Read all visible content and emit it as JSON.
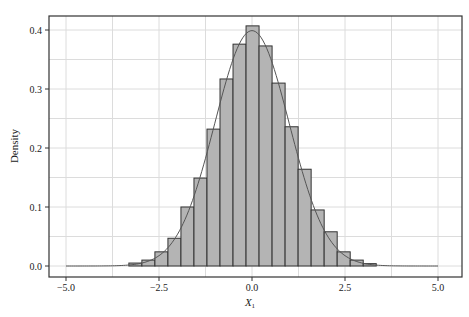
{
  "chart_data": {
    "type": "bar",
    "subtype": "histogram_with_density_curve",
    "title": "",
    "xlabel": "X",
    "xlabel_subscript": "1",
    "ylabel": "Density",
    "xlim": [
      -5.5,
      5.6
    ],
    "ylim": [
      -0.018,
      0.42
    ],
    "x_ticks": [
      -5.0,
      -2.5,
      0.0,
      2.5,
      5.0
    ],
    "x_tick_labels": [
      "−5.0",
      "−2.5",
      "0.0",
      "2.5",
      "5.0"
    ],
    "y_ticks": [
      0.0,
      0.1,
      0.2,
      0.3,
      0.4
    ],
    "y_tick_labels": [
      "0.0",
      "0.1",
      "0.2",
      "0.3",
      "0.4"
    ],
    "grid": true,
    "minor_grid": true,
    "legend": null,
    "bin_width": 0.35,
    "bins": [
      {
        "x0": -3.31,
        "x1": -2.96,
        "density": 0.005
      },
      {
        "x0": -2.96,
        "x1": -2.61,
        "density": 0.01
      },
      {
        "x0": -2.61,
        "x1": -2.26,
        "density": 0.024
      },
      {
        "x0": -2.26,
        "x1": -1.91,
        "density": 0.047
      },
      {
        "x0": -1.91,
        "x1": -1.56,
        "density": 0.1
      },
      {
        "x0": -1.56,
        "x1": -1.21,
        "density": 0.149
      },
      {
        "x0": -1.21,
        "x1": -0.86,
        "density": 0.232
      },
      {
        "x0": -0.86,
        "x1": -0.51,
        "density": 0.317
      },
      {
        "x0": -0.51,
        "x1": -0.16,
        "density": 0.376
      },
      {
        "x0": -0.16,
        "x1": 0.19,
        "density": 0.407
      },
      {
        "x0": 0.19,
        "x1": 0.54,
        "density": 0.373
      },
      {
        "x0": 0.54,
        "x1": 0.89,
        "density": 0.31
      },
      {
        "x0": 0.89,
        "x1": 1.24,
        "density": 0.236
      },
      {
        "x0": 1.24,
        "x1": 1.59,
        "density": 0.164
      },
      {
        "x0": 1.59,
        "x1": 1.94,
        "density": 0.095
      },
      {
        "x0": 1.94,
        "x1": 2.29,
        "density": 0.058
      },
      {
        "x0": 2.29,
        "x1": 2.64,
        "density": 0.024
      },
      {
        "x0": 2.64,
        "x1": 2.99,
        "density": 0.01
      },
      {
        "x0": 2.99,
        "x1": 3.34,
        "density": 0.004
      }
    ],
    "density_curve": {
      "type": "line",
      "description": "standard normal density N(0,1)",
      "x_range": [
        -5.0,
        5.0
      ],
      "peak": 0.399
    },
    "colors": {
      "bar_fill": "#b4b4b4",
      "bar_edge": "#333333",
      "curve": "#555555",
      "grid": "#dcdcdc",
      "frame": "#333333"
    }
  }
}
